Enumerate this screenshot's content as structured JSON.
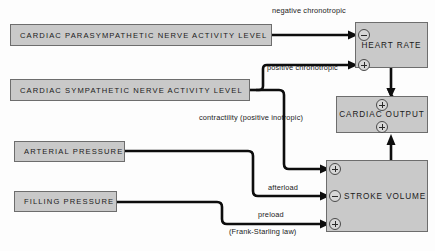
{
  "diagram": {
    "background_color": "#fdfdfd",
    "node_fill_color": "#c9c9c9",
    "node_border_color": "#6d6d6d",
    "wire_color": "#0d0d0d",
    "nodes": {
      "parasympathetic": "CARDIAC PARASYMPATHETIC NERVE ACTIVITY LEVEL",
      "sympathetic": "CARDIAC SYMPATHETIC NERVE ACTIVITY LEVEL",
      "arterial_pressure": "ARTERIAL PRESSURE",
      "filling_pressure": "FILLING PRESSURE",
      "heart_rate": "HEART RATE",
      "cardiac_output": "CARDIAC OUTPUT",
      "stroke_volume": "STROKE VOLUME"
    },
    "edge_labels": {
      "negative_chronotropic": "negative chronotropic",
      "positive_chronotropic": "positive chronotropic",
      "contractility": "contractility (positive inotropic)",
      "afterload": "afterload",
      "preload": "preload",
      "frank_starling": "(Frank-Starling law)"
    },
    "ports": [
      {
        "node": "heart_rate",
        "sign": "-",
        "edge": "negative chronotropic"
      },
      {
        "node": "heart_rate",
        "sign": "+",
        "edge": "positive chronotropic"
      },
      {
        "node": "cardiac_output",
        "sign": "+",
        "edge": "heart rate"
      },
      {
        "node": "cardiac_output",
        "sign": "+",
        "edge": "stroke volume"
      },
      {
        "node": "stroke_volume",
        "sign": "+",
        "edge": "contractility (positive inotropic)"
      },
      {
        "node": "stroke_volume",
        "sign": "-",
        "edge": "afterload"
      },
      {
        "node": "stroke_volume",
        "sign": "+",
        "edge": "preload"
      }
    ]
  }
}
